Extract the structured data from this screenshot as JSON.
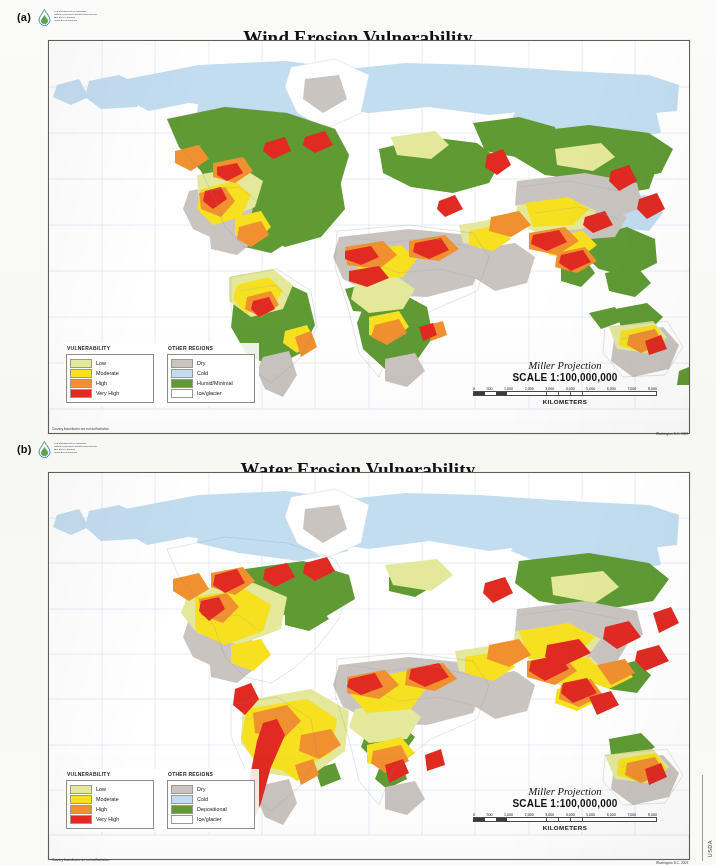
{
  "document": {
    "side_credit": "USDA"
  },
  "agency": {
    "line1": "U.S. Department of Agriculture",
    "line2": "Natural Resources Conservation Service",
    "line3": "Soil Survey Division",
    "line4": "World Soil Resources",
    "logo_icon": "usda-nrcs-water-drop-logo"
  },
  "panels": [
    {
      "letter": "(a)",
      "title": "Wind Erosion Vulnerability",
      "legend": {
        "vulnerability_header": "VULNERABILITY",
        "other_header": "OTHER REGIONS",
        "vulnerability": [
          {
            "label": "Low",
            "color": "#e3e89a"
          },
          {
            "label": "Moderate",
            "color": "#f6e01f"
          },
          {
            "label": "High",
            "color": "#f0902f"
          },
          {
            "label": "Very High",
            "color": "#e02a22"
          }
        ],
        "other": [
          {
            "label": "Dry",
            "color": "#c9c4c0"
          },
          {
            "label": "Cold",
            "color": "#c3ddf0"
          },
          {
            "label": "Humid/Minimal",
            "color": "#5f9a33"
          },
          {
            "label": "Ice/glacier",
            "color": "#ffffff"
          }
        ]
      },
      "scale": {
        "projection": "Miller Projection",
        "ratio": "SCALE 1:100,000,000",
        "ticks": [
          "0",
          "500",
          "1,000",
          "2,000",
          "3,000",
          "4,000",
          "5,000",
          "6,000",
          "7,000",
          "8,000"
        ],
        "unit": "KILOMETERS"
      },
      "footnote_left": "Country boundaries are not authoritative.",
      "footnote_right": "Washington D.C. 2003"
    },
    {
      "letter": "(b)",
      "title": "Water Erosion Vulnerability",
      "legend": {
        "vulnerability_header": "VULNERABILITY",
        "other_header": "OTHER REGIONS",
        "vulnerability": [
          {
            "label": "Low",
            "color": "#e3e89a"
          },
          {
            "label": "Moderate",
            "color": "#f6e01f"
          },
          {
            "label": "High",
            "color": "#f0902f"
          },
          {
            "label": "Very High",
            "color": "#e02a22"
          }
        ],
        "other": [
          {
            "label": "Dry",
            "color": "#c9c4c0"
          },
          {
            "label": "Cold",
            "color": "#c3ddf0"
          },
          {
            "label": "Depositional",
            "color": "#5f9a33"
          },
          {
            "label": "Ice/glacier",
            "color": "#ffffff"
          }
        ]
      },
      "scale": {
        "projection": "Miller Projection",
        "ratio": "SCALE 1:100,000,000",
        "ticks": [
          "0",
          "500",
          "1,000",
          "2,000",
          "3,000",
          "4,000",
          "5,000",
          "6,000",
          "7,000",
          "8,000"
        ],
        "unit": "KILOMETERS"
      },
      "footnote_left": "Country boundaries are not authoritative.",
      "footnote_right": "Washington D.C. 2003"
    }
  ],
  "map_palette": {
    "ocean": "#ffffff",
    "graticule": "#b9c9dd",
    "border": "#6d6d64",
    "cold": "#c3ddf0",
    "dry": "#c9c4c0",
    "humid": "#5f9a33",
    "low": "#e3e89a",
    "moderate": "#f6e01f",
    "high": "#f0902f",
    "very_high": "#e02a22",
    "ice": "#ffffff"
  }
}
